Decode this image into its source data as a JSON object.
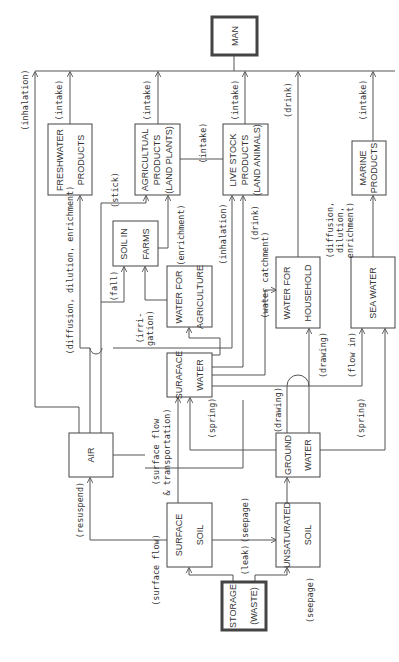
{
  "nodes": {
    "man": {
      "lines": [
        "MAN"
      ]
    },
    "freshwater_products": {
      "lines": [
        "FRESHWATER",
        "PRODUCTS"
      ]
    },
    "agricultural_products": {
      "lines": [
        "AGRICULTUAL",
        "PRODUCTS",
        "(LAND PLANTS)"
      ]
    },
    "live_stock_products": {
      "lines": [
        "LIVE STOCK",
        "PRODUCTS",
        "(LAND ANIMALS)"
      ]
    },
    "marine_products": {
      "lines": [
        "MARINE",
        "PRODUCTS"
      ]
    },
    "soil_in_farms": {
      "lines": [
        "SOIL IN",
        "FARMS"
      ]
    },
    "water_for_agriculture": {
      "lines": [
        "WATER FOR",
        "AGRICULTURE"
      ]
    },
    "water_for_household": {
      "lines": [
        "WATER FOR",
        "HOUSEHOLD"
      ]
    },
    "sea_water": {
      "lines": [
        "SEA WATER"
      ]
    },
    "surface_water": {
      "lines": [
        "SURAFACE",
        "WATER"
      ]
    },
    "air": {
      "lines": [
        "AIR"
      ]
    },
    "ground_water": {
      "lines": [
        "GROUND",
        "WATER"
      ]
    },
    "surface_soil": {
      "lines": [
        "SURFACE",
        "SOIL"
      ]
    },
    "unsaturated_soil": {
      "lines": [
        "UNSATURATED",
        "SOIL"
      ]
    },
    "storage_waste": {
      "lines": [
        "STORAGE",
        "(WASTE)"
      ]
    }
  },
  "edges": {
    "inhalation_man": "(inhalation)",
    "intake_freshwater": "(intake)",
    "intake_agricultural": "(intake)",
    "intake_livestock": "(intake)",
    "intake_agri_to_livestock": "(intake)",
    "drink_man": "(drink)",
    "intake_marine": "(intake)",
    "diffusion_freshwater": "(diffusion, dilution, enrichment)",
    "stick": "(stick)",
    "enrichment_farms": "(enrichment)",
    "fall": "(fall)",
    "irrigation_1": "(irri-",
    "irrigation_2": "gation)",
    "inhalation_livestock": "(inhalation)",
    "drink_livestock": "(drink)",
    "water_catchment": "(water catchment)",
    "diffusion_marine_1": "(diffusion,",
    "diffusion_marine_2": "dilution,",
    "diffusion_marine_3": "enrichment)",
    "drawing_household": "(drawing)",
    "flow_in": "(flow in)",
    "spring_surface": "(spring)",
    "drawing_ground": "(drawing)",
    "spring_sea": "(spring)",
    "surface_flow_transport_1": "(surface  flow",
    "surface_flow_transport_2": "& transportation)",
    "resuspend": "(resuspend)",
    "surface_flow": "(surface  flow)",
    "seepage_soil": "(seepage)",
    "leak": "(leak)",
    "seepage_storage": "(seepage)"
  }
}
